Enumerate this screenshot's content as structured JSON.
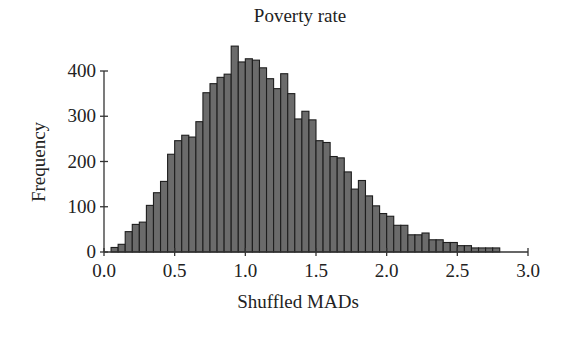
{
  "chart_data": {
    "type": "bar",
    "subtype": "histogram",
    "title": "Poverty rate",
    "xlabel": "Shuffled MADs",
    "ylabel": "Frequency",
    "xlim": [
      0.0,
      3.0
    ],
    "ylim": [
      0,
      400
    ],
    "xticks": [
      0.0,
      0.5,
      1.0,
      1.5,
      2.0,
      2.5,
      3.0
    ],
    "xtick_labels": [
      "0.0",
      "0.5",
      "1.0",
      "1.5",
      "2.0",
      "2.5",
      "3.0"
    ],
    "yticks": [
      0,
      100,
      200,
      300,
      400
    ],
    "ytick_labels": [
      "0",
      "100",
      "200",
      "300",
      "400"
    ],
    "grid": false,
    "legend": null,
    "bin_width": 0.05,
    "bin_start": 0.05,
    "bin_edges_left": [
      0.05,
      0.1,
      0.15,
      0.2,
      0.25,
      0.3,
      0.35,
      0.4,
      0.45,
      0.5,
      0.55,
      0.6,
      0.65,
      0.7,
      0.75,
      0.8,
      0.85,
      0.9,
      0.95,
      1.0,
      1.05,
      1.1,
      1.15,
      1.2,
      1.25,
      1.3,
      1.35,
      1.4,
      1.45,
      1.5,
      1.55,
      1.6,
      1.65,
      1.7,
      1.75,
      1.8,
      1.85,
      1.9,
      1.95,
      2.0,
      2.05,
      2.1,
      2.15,
      2.2,
      2.25,
      2.3,
      2.35,
      2.4,
      2.45,
      2.5,
      2.55,
      2.6,
      2.65,
      2.7,
      2.75
    ],
    "values": [
      10,
      17,
      45,
      61,
      66,
      103,
      131,
      156,
      216,
      246,
      258,
      254,
      288,
      352,
      372,
      386,
      393,
      455,
      420,
      427,
      424,
      407,
      383,
      361,
      394,
      350,
      294,
      311,
      292,
      246,
      242,
      211,
      208,
      177,
      139,
      158,
      124,
      102,
      85,
      79,
      59,
      59,
      38,
      38,
      42,
      27,
      27,
      21,
      21,
      14,
      14,
      9,
      9,
      9,
      9
    ],
    "colors": {
      "bar_fill": "#6b6b6b",
      "bar_edge": "#1e1e1e",
      "axis": "#333333",
      "text": "#222222"
    }
  }
}
